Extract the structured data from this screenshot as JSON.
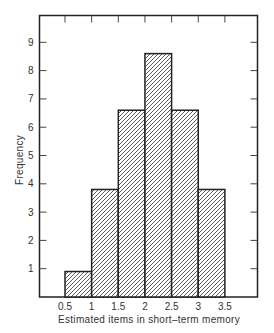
{
  "chart_data": {
    "type": "bar",
    "subtype": "histogram",
    "title": "",
    "xlabel": "Estimated items in short–term memory",
    "ylabel": "Frequency",
    "bins": [
      {
        "from": 0.5,
        "to": 1.0,
        "value": 0.9
      },
      {
        "from": 1.0,
        "to": 1.5,
        "value": 3.8
      },
      {
        "from": 1.5,
        "to": 2.0,
        "value": 6.6
      },
      {
        "from": 2.0,
        "to": 2.5,
        "value": 8.6
      },
      {
        "from": 2.5,
        "to": 3.0,
        "value": 6.6
      },
      {
        "from": 3.0,
        "to": 3.5,
        "value": 3.8
      }
    ],
    "categories": [
      "0.5-1",
      "1-1.5",
      "1.5-2",
      "2-2.5",
      "2.5-3",
      "3-3.5"
    ],
    "values": [
      0.9,
      3.8,
      6.6,
      8.6,
      6.6,
      3.8
    ],
    "x_ticks": [
      "0.5",
      "1",
      "1.5",
      "2",
      "2.5",
      "3",
      "3.5"
    ],
    "y_ticks": [
      "1",
      "2",
      "3",
      "4",
      "5",
      "6",
      "7",
      "8",
      "9"
    ],
    "xlim": [
      0,
      4.1
    ],
    "ylim": [
      0,
      9.6
    ],
    "grid": false,
    "legend": null,
    "bar_fill": "diagonal-hatch",
    "colors": {
      "frame": "#222222",
      "hatch": "#333333",
      "background": "#ffffff"
    }
  }
}
